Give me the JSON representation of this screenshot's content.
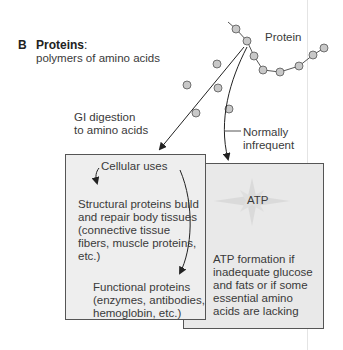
{
  "panel": {
    "letter": "B",
    "title": "Proteins",
    "title_suffix": ":",
    "subtitle": "polymers of amino acids"
  },
  "protein_chain": {
    "label": "Protein",
    "circle_color": "#c8c8c8",
    "stroke_color": "#555555"
  },
  "pathways": {
    "digestion_label_line1": "GI digestion",
    "digestion_label_line2": "to amino acids",
    "infrequent_label_line1": "Normally",
    "infrequent_label_line2": "infrequent"
  },
  "cellular_uses_box": {
    "heading": "Cellular uses",
    "structural_text": "Structural proteins build and repair body tissues (connective tissue fibers, muscle proteins, etc.)",
    "functional_text": "Functional proteins (enzymes, antibodies, hemoglobin, etc.)",
    "background": "#eeeeee"
  },
  "atp_box": {
    "star_label": "ATP",
    "text": "ATP formation if inadequate glucose and fats or if some essential amino acids are lacking",
    "background": "#e9e9e9"
  }
}
